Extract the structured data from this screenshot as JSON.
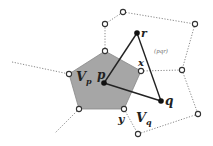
{
  "diagram": {
    "colors": {
      "cell_fill": "#a6a6a6",
      "cell_stroke": "#888888",
      "edge": "#222222",
      "dotted": "#888888",
      "site": "#111111",
      "vertex_fill": "#ffffff",
      "vertex_stroke": "#333333"
    },
    "labels": {
      "p": "p",
      "q": "q",
      "r": "r",
      "x": "x",
      "y": "y",
      "Vp_main": "V",
      "Vp_sub": "p",
      "Vq_main": "V",
      "Vq_sub": "q",
      "circle_label": "(pqr)"
    },
    "sites": {
      "p": [
        104,
        83
      ],
      "q": [
        161,
        101
      ],
      "r": [
        137,
        33
      ]
    },
    "cell_Vp": [
      [
        105,
        51
      ],
      [
        141,
        71
      ],
      [
        124,
        109
      ],
      [
        79,
        109
      ],
      [
        69,
        74
      ]
    ],
    "voronoi_vertices": [
      [
        105,
        51
      ],
      [
        141,
        71
      ],
      [
        124,
        109
      ],
      [
        79,
        109
      ],
      [
        69,
        74
      ],
      [
        105,
        24
      ],
      [
        123,
        12
      ],
      [
        195,
        24
      ],
      [
        182,
        70
      ],
      [
        198,
        114
      ],
      [
        138,
        134
      ]
    ]
  }
}
